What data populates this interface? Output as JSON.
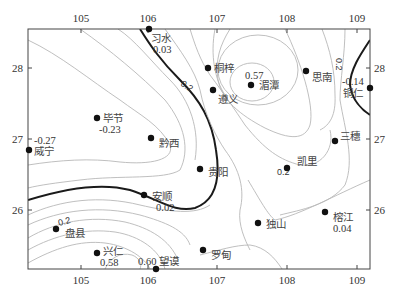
{
  "map": {
    "type": "contour-map",
    "x_axis": {
      "ticks": [
        {
          "label": "105",
          "x": 81
        },
        {
          "label": "106",
          "x": 148
        },
        {
          "label": "107",
          "x": 217
        },
        {
          "label": "108",
          "x": 287
        },
        {
          "label": "109",
          "x": 357
        }
      ]
    },
    "y_axis": {
      "ticks": [
        {
          "label": "28",
          "y": 68
        },
        {
          "label": "27",
          "y": 139
        },
        {
          "label": "26",
          "y": 210
        }
      ]
    },
    "contour_labels": [
      {
        "text": "0.2",
        "x": 180,
        "y": 85,
        "rotate": 35
      },
      {
        "text": "0.2",
        "x": 336,
        "y": 58,
        "rotate": 90
      },
      {
        "text": "0.2",
        "x": 277,
        "y": 175,
        "rotate": 0
      },
      {
        "text": "0.2",
        "x": 59,
        "y": 226,
        "rotate": -15
      }
    ],
    "stations": [
      {
        "name": "习水",
        "value": "0.03",
        "x": 149,
        "y": 29
      },
      {
        "name": "桐梓",
        "value": "",
        "x": 208,
        "y": 68
      },
      {
        "name": "遵义",
        "value": "",
        "x": 213,
        "y": 90
      },
      {
        "name": "湄潭",
        "value": "0.57",
        "x": 251,
        "y": 85
      },
      {
        "name": "思南",
        "value": "",
        "x": 306,
        "y": 71
      },
      {
        "name": "铜仁",
        "value": "-0.14",
        "x": 370,
        "y": 88
      },
      {
        "name": "毕节",
        "value": "-0.23",
        "x": 97,
        "y": 118
      },
      {
        "name": "黔西",
        "value": "",
        "x": 151,
        "y": 138
      },
      {
        "name": "威宁",
        "value": "-0.27",
        "x": 28,
        "y": 150
      },
      {
        "name": "三穗",
        "value": "",
        "x": 335,
        "y": 141
      },
      {
        "name": "贵阳",
        "value": "",
        "x": 200,
        "y": 169
      },
      {
        "name": "凯里",
        "value": "0.2",
        "x": 287,
        "y": 168
      },
      {
        "name": "安顺",
        "value": "0.02",
        "x": 144,
        "y": 195
      },
      {
        "name": "榕江",
        "value": "0.04",
        "x": 325,
        "y": 212
      },
      {
        "name": "盘县",
        "value": "",
        "x": 56,
        "y": 229
      },
      {
        "name": "独山",
        "value": "",
        "x": 258,
        "y": 223
      },
      {
        "name": "罗甸",
        "value": "",
        "x": 203,
        "y": 250
      },
      {
        "name": "兴仁",
        "value": "0.58",
        "x": 97,
        "y": 253
      },
      {
        "name": "望谟",
        "value": "0.60",
        "x": 156,
        "y": 269
      }
    ],
    "colors": {
      "contour": "#b8b8b8",
      "zero_line": "#1a1a1a",
      "station": "#111111",
      "frame": "#444444"
    }
  }
}
